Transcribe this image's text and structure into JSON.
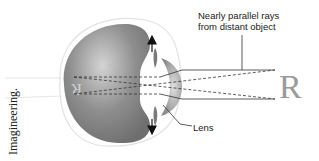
{
  "credit": "Imagineering.",
  "labels": {
    "rays": "Nearly parallel rays from distant object",
    "rays_line1": "Nearly parallel rays",
    "rays_line2": "from distant object",
    "lens": "Lens"
  },
  "object_letter": "R",
  "image_letter": "R (inverted on retina)",
  "colors": {
    "eyeball": "#8a8a8a",
    "eyeball_highlight": "#c8c8c8",
    "lens": "#9e9e9e",
    "outline": "#dddddd",
    "lines": "#333333",
    "object": "#9a9a9a"
  }
}
